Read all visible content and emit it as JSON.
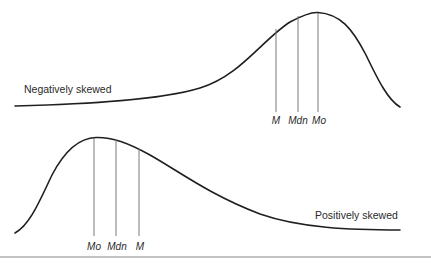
{
  "diagram": {
    "negative": {
      "label": "Negatively skewed",
      "measures": [
        {
          "key": "mean",
          "label": "M",
          "x": 276,
          "top": 43
        },
        {
          "key": "median",
          "label": "Mdn",
          "x": 298,
          "top": 19
        },
        {
          "key": "mode",
          "label": "Mo",
          "x": 318,
          "top": 13
        }
      ]
    },
    "positive": {
      "label": "Positively skewed",
      "measures": [
        {
          "key": "mode",
          "label": "Mo",
          "x": 94,
          "top": 138
        },
        {
          "key": "median",
          "label": "Mdn",
          "x": 116,
          "top": 139
        },
        {
          "key": "mean",
          "label": "M",
          "x": 139,
          "top": 148
        }
      ]
    },
    "colors": {
      "curve": "#1f1f1f",
      "measure_line": "#7a7a7a",
      "rule": "#8a8a8a",
      "background": "#ffffff"
    }
  }
}
